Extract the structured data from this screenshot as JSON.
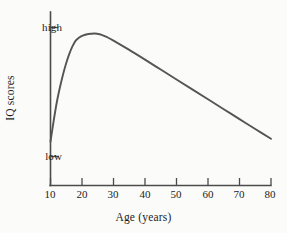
{
  "chart_data": {
    "type": "line",
    "title": "",
    "xlabel": "Age (years)",
    "ylabel": "IQ scores",
    "xlim": [
      10,
      80
    ],
    "ylim": [
      0,
      1
    ],
    "grid": false,
    "legend": "none",
    "x_ticks": [
      "10",
      "20",
      "30",
      "40",
      "50",
      "60",
      "70",
      "80"
    ],
    "x_tick_values": [
      10,
      20,
      30,
      40,
      50,
      60,
      70,
      80
    ],
    "y_ticks": [
      "high",
      "low"
    ],
    "y_tick_values": [
      0.92,
      0.23
    ],
    "annotation": "IQ scores rise steeply through adolescence, peak in the mid-twenties, then decline steadily with age.",
    "series": [
      {
        "name": "IQ scores by age",
        "color": "#555555",
        "x": [
          10,
          11,
          12,
          13,
          14,
          15,
          16,
          17,
          18,
          19,
          20,
          22,
          24,
          25,
          26,
          28,
          30,
          35,
          40,
          45,
          50,
          55,
          60,
          65,
          70,
          75,
          80
        ],
        "y": [
          0.31,
          0.42,
          0.52,
          0.6,
          0.67,
          0.73,
          0.78,
          0.82,
          0.85,
          0.865,
          0.875,
          0.885,
          0.888,
          0.886,
          0.882,
          0.868,
          0.85,
          0.8,
          0.748,
          0.695,
          0.642,
          0.589,
          0.536,
          0.483,
          0.43,
          0.377,
          0.325
        ]
      }
    ]
  },
  "axes": {
    "x_axis_label": "Age (years)",
    "y_axis_label": "IQ scores",
    "y_high_label": "high",
    "y_low_label": "low",
    "x_tick_10": "10",
    "x_tick_20": "20",
    "x_tick_30": "30",
    "x_tick_40": "40",
    "x_tick_50": "50",
    "x_tick_60": "60",
    "x_tick_70": "70",
    "x_tick_80": "80"
  },
  "colors": {
    "curve": "#555555",
    "axis": "#4b4b4b",
    "text": "#1d1d1d",
    "background": "#fbfbf9"
  }
}
